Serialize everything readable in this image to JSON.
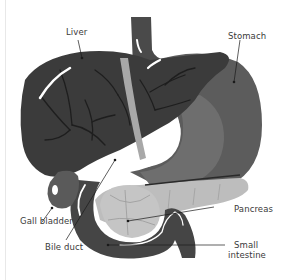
{
  "diagram": {
    "type": "anatomical-illustration",
    "labels": [
      {
        "id": "liver",
        "text": "Liver"
      },
      {
        "id": "stomach",
        "text": "Stomach"
      },
      {
        "id": "gall_bladder",
        "text": "Gall bladder"
      },
      {
        "id": "pancreas",
        "text": "Pancreas"
      },
      {
        "id": "bile_duct",
        "text": "Bile duct"
      },
      {
        "id": "small_intestine_1",
        "text": "Small"
      },
      {
        "id": "small_intestine_2",
        "text": "intestine"
      }
    ],
    "colors": {
      "background": "#ffffff",
      "liver": "#3b3b3b",
      "liver_veins": "#1e1e1e",
      "stomach_outer": "#5c5c5c",
      "stomach_inner": "#6e6e6e",
      "esophagus": "#4a4a4a",
      "intestine": "#454545",
      "pancreas": "#bdbdbd",
      "gall_bladder": "#5a5a5a",
      "bile_duct_light": "#a8a8a8",
      "label_text": "#3a3a3a",
      "leader_line": "#1a1a1a"
    }
  }
}
